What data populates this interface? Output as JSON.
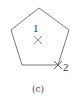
{
  "figure": {
    "caption": "(c)",
    "shape": "pentagon",
    "vertices": [
      [
        39,
        8
      ],
      [
        69,
        30
      ],
      [
        58,
        65
      ],
      [
        22,
        65
      ],
      [
        11,
        30
      ]
    ],
    "stroke_color": "#777777",
    "points": [
      {
        "label": "1",
        "marker": "x-mark-icon",
        "position": [
          38,
          40
        ],
        "description": "center"
      },
      {
        "label": "2",
        "marker": "x-mark-icon",
        "position": [
          58,
          65
        ],
        "description": "bottom-right vertex"
      }
    ]
  }
}
